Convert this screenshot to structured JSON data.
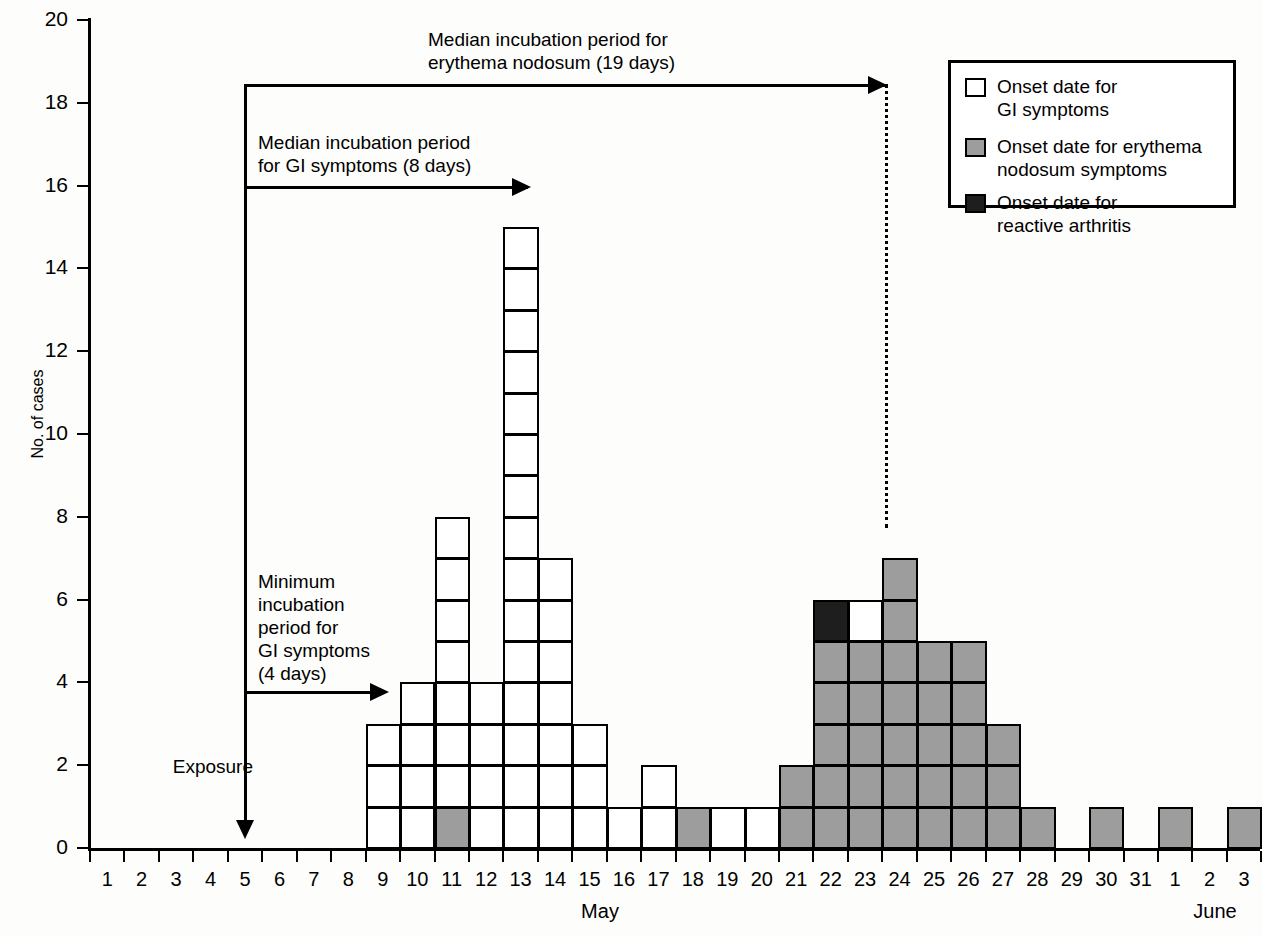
{
  "axes": {
    "y_title": "No. of cases",
    "y_ticks": [
      "0",
      "2",
      "4",
      "6",
      "8",
      "10",
      "12",
      "14",
      "16",
      "18",
      "20"
    ],
    "x_ticks": [
      "1",
      "2",
      "3",
      "4",
      "5",
      "6",
      "7",
      "8",
      "9",
      "10",
      "11",
      "12",
      "13",
      "14",
      "15",
      "16",
      "17",
      "18",
      "19",
      "20",
      "21",
      "22",
      "23",
      "24",
      "25",
      "26",
      "27",
      "28",
      "29",
      "30",
      "31",
      "1",
      "2",
      "3"
    ],
    "month_left": "May",
    "month_right": "June"
  },
  "legend": {
    "items": [
      {
        "key": "gi",
        "label": "Onset date for\nGI symptoms",
        "color": "#ffffff"
      },
      {
        "key": "en",
        "label": "Onset date for erythema\nnodosum symptoms",
        "color": "#9d9d9d"
      },
      {
        "key": "ra",
        "label": "Onset date for\nreactive arthritis",
        "color": "#1e1e1e"
      }
    ]
  },
  "annotations": {
    "median_en": "Median incubation period for\nerythema nodosum (19 days)",
    "median_gi": "Median incubation period\nfor GI symptoms (8 days)",
    "min_gi": "Minimum\nincubation\nperiod for\nGI symptoms\n(4 days)",
    "exposure": "Exposure"
  },
  "chart_data": {
    "type": "bar",
    "title": "",
    "xlabel": "",
    "ylabel": "No. of cases",
    "ylim": [
      0,
      20
    ],
    "ytick_step": 2,
    "grid": false,
    "legend_position": "top-right",
    "categories": [
      "May 1",
      "May 2",
      "May 3",
      "May 4",
      "May 5",
      "May 6",
      "May 7",
      "May 8",
      "May 9",
      "May 10",
      "May 11",
      "May 12",
      "May 13",
      "May 14",
      "May 15",
      "May 16",
      "May 17",
      "May 18",
      "May 19",
      "May 20",
      "May 21",
      "May 22",
      "May 23",
      "May 24",
      "May 25",
      "May 26",
      "May 27",
      "May 28",
      "May 29",
      "May 30",
      "May 31",
      "June 1",
      "June 2",
      "June 3"
    ],
    "series": [
      {
        "name": "Onset date for GI symptoms",
        "key": "gi",
        "color": "#ffffff",
        "values": [
          0,
          0,
          0,
          0,
          0,
          0,
          0,
          0,
          3,
          4,
          7,
          4,
          15,
          7,
          3,
          1,
          2,
          0,
          1,
          1,
          0,
          0,
          1,
          0,
          0,
          0,
          0,
          0,
          0,
          0,
          0,
          0,
          0,
          0
        ]
      },
      {
        "name": "Onset date for erythema nodosum symptoms",
        "key": "en",
        "color": "#9d9d9d",
        "values": [
          0,
          0,
          0,
          0,
          0,
          0,
          0,
          0,
          0,
          0,
          1,
          0,
          0,
          0,
          0,
          0,
          0,
          1,
          0,
          0,
          2,
          5,
          5,
          7,
          5,
          5,
          3,
          1,
          0,
          1,
          0,
          1,
          0,
          1
        ]
      },
      {
        "name": "Onset date for reactive arthritis",
        "key": "ra",
        "color": "#1e1e1e",
        "values": [
          0,
          0,
          0,
          0,
          0,
          0,
          0,
          0,
          0,
          0,
          0,
          0,
          0,
          0,
          0,
          0,
          0,
          0,
          0,
          0,
          0,
          1,
          0,
          0,
          0,
          0,
          0,
          0,
          0,
          0,
          0,
          0,
          0,
          0
        ]
      }
    ],
    "stacks": [
      {
        "day": "May 9",
        "cells": [
          "gi",
          "gi",
          "gi"
        ]
      },
      {
        "day": "May 10",
        "cells": [
          "gi",
          "gi",
          "gi",
          "gi"
        ]
      },
      {
        "day": "May 11",
        "cells": [
          "en",
          "gi",
          "gi",
          "gi",
          "gi",
          "gi",
          "gi",
          "gi"
        ]
      },
      {
        "day": "May 12",
        "cells": [
          "gi",
          "gi",
          "gi",
          "gi"
        ]
      },
      {
        "day": "May 13",
        "cells": [
          "gi",
          "gi",
          "gi",
          "gi",
          "gi",
          "gi",
          "gi",
          "gi",
          "gi",
          "gi",
          "gi",
          "gi",
          "gi",
          "gi",
          "gi"
        ]
      },
      {
        "day": "May 14",
        "cells": [
          "gi",
          "gi",
          "gi",
          "gi",
          "gi",
          "gi",
          "gi"
        ]
      },
      {
        "day": "May 15",
        "cells": [
          "gi",
          "gi",
          "gi"
        ]
      },
      {
        "day": "May 16",
        "cells": [
          "gi"
        ]
      },
      {
        "day": "May 17",
        "cells": [
          "gi",
          "gi"
        ]
      },
      {
        "day": "May 18",
        "cells": [
          "en"
        ]
      },
      {
        "day": "May 19",
        "cells": [
          "gi"
        ]
      },
      {
        "day": "May 20",
        "cells": [
          "gi"
        ]
      },
      {
        "day": "May 21",
        "cells": [
          "en",
          "en"
        ]
      },
      {
        "day": "May 22",
        "cells": [
          "en",
          "en",
          "en",
          "en",
          "en",
          "ra"
        ]
      },
      {
        "day": "May 23",
        "cells": [
          "en",
          "en",
          "en",
          "en",
          "en",
          "gi"
        ]
      },
      {
        "day": "May 24",
        "cells": [
          "en",
          "en",
          "en",
          "en",
          "en",
          "en",
          "en"
        ]
      },
      {
        "day": "May 25",
        "cells": [
          "en",
          "en",
          "en",
          "en",
          "en"
        ]
      },
      {
        "day": "May 26",
        "cells": [
          "en",
          "en",
          "en",
          "en",
          "en"
        ]
      },
      {
        "day": "May 27",
        "cells": [
          "en",
          "en",
          "en"
        ]
      },
      {
        "day": "May 28",
        "cells": [
          "en"
        ]
      },
      {
        "day": "May 30",
        "cells": [
          "en"
        ]
      },
      {
        "day": "June 1",
        "cells": [
          "en"
        ]
      },
      {
        "day": "June 3",
        "cells": [
          "en"
        ]
      }
    ]
  }
}
